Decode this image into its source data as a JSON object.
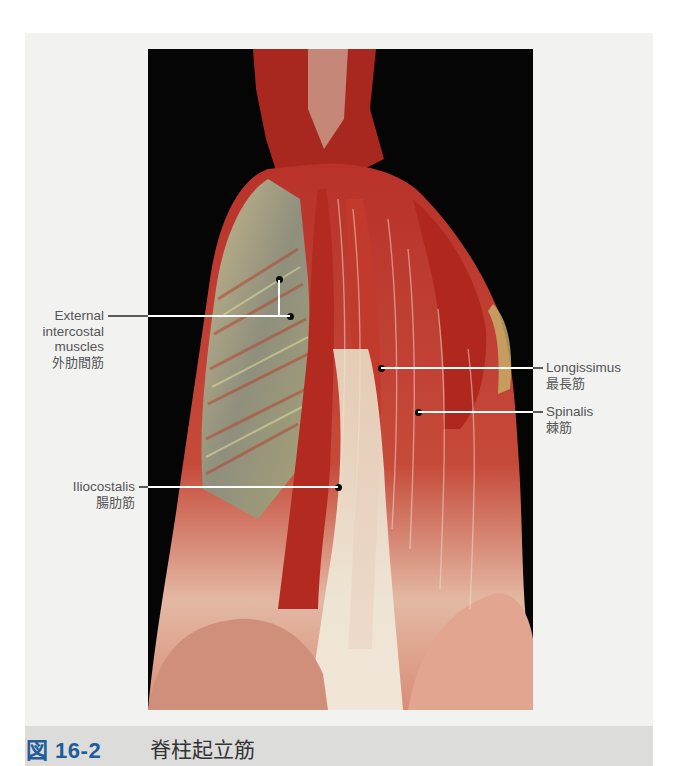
{
  "figure": {
    "number": "図 16-2",
    "title": "脊柱起立筋",
    "photo_description": "Posterior dissection of the back showing the erector spinae muscle group",
    "colors": {
      "caption_number": "#1f5c99",
      "caption_bar": "#dcdcdb",
      "panel_background": "#f2f2f1",
      "photo_background": "#050505"
    }
  },
  "labels": [
    {
      "id": "external-intercostal",
      "en_lines": [
        "External",
        "intercostal",
        "muscles"
      ],
      "jp": "外肋間筋",
      "side": "left"
    },
    {
      "id": "longissimus",
      "en_lines": [
        "Longissimus"
      ],
      "jp": "最長筋",
      "side": "right"
    },
    {
      "id": "spinalis",
      "en_lines": [
        "Spinalis"
      ],
      "jp": "棘筋",
      "side": "right"
    },
    {
      "id": "iliocostalis",
      "en_lines": [
        "Iliocostalis"
      ],
      "jp": "腸肋筋",
      "side": "left"
    }
  ]
}
